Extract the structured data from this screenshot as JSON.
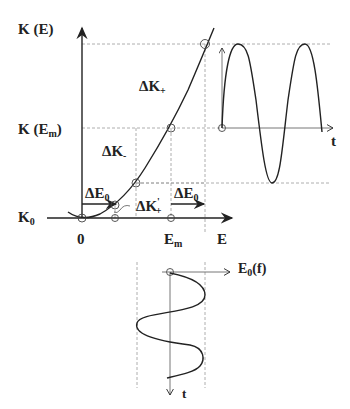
{
  "labels": {
    "k_of_e": "K (E)",
    "k_of_em_prefix": "K (E",
    "k_of_em_sub": "m",
    "k_of_em_suffix": ")",
    "k0_main": "K",
    "k0_sub": "0",
    "origin": "0",
    "em_main": "E",
    "em_sub": "m",
    "e_axis": "E",
    "t_right": "t",
    "t_bottom": "t",
    "delta_k_plus_main": "ΔK",
    "delta_k_plus_sub": "+",
    "delta_k_minus_main": "ΔK",
    "delta_k_minus_sub": "-",
    "delta_k_plus_prime_main": "ΔK",
    "delta_k_plus_prime_sup": "'",
    "delta_k_plus_prime_sub": "+",
    "delta_e0_left_main": "ΔE",
    "delta_e0_left_sub": "0",
    "delta_e0_right_main": "ΔE",
    "delta_e0_right_sub": "0",
    "e0f_main": "E",
    "e0f_sub": "0",
    "e0f_suffix": "(f)"
  },
  "colors": {
    "ink": "#222222",
    "guide": "#9a9a9a"
  }
}
